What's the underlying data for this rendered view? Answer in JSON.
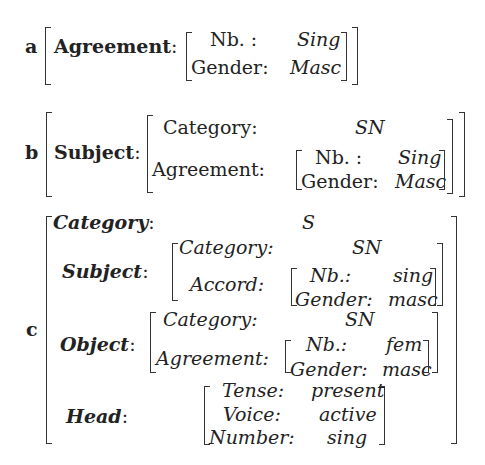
{
  "a": {
    "label": "a",
    "feature": "Agreement",
    "colon": ":",
    "inner": [
      {
        "attr": "Nb. :",
        "value": "Sing"
      },
      {
        "attr": "Gender:",
        "value": "Masc"
      }
    ]
  },
  "b": {
    "label": "b",
    "feature": "Subject",
    "colon": ":",
    "rows": [
      {
        "attr": "Category:",
        "value": "SN"
      },
      {
        "attr": "Agreement:",
        "inner": [
          {
            "attr": "Nb. :",
            "value": "Sing"
          },
          {
            "attr": "Gender:",
            "value": "Masc"
          }
        ]
      }
    ]
  },
  "c": {
    "label": "c",
    "category": {
      "attr": "Category",
      "colon": ":",
      "value": "S"
    },
    "subject": {
      "attr": "Subject",
      "colon": ":",
      "rows": [
        {
          "attr": "Category:",
          "value": "SN"
        },
        {
          "attr": "Accord:",
          "inner": [
            {
              "attr": "Nb.:",
              "value": "sing"
            },
            {
              "attr": "Gender:",
              "value": "masc"
            }
          ]
        }
      ]
    },
    "object": {
      "attr": "Object",
      "colon": ":",
      "rows": [
        {
          "attr": "Category:",
          "value": "SN"
        },
        {
          "attr": "Agreement:",
          "inner": [
            {
              "attr": "Nb.:",
              "value": "fem"
            },
            {
              "attr": "Gender:",
              "value": "masc"
            }
          ]
        }
      ]
    },
    "head": {
      "attr": "Head",
      "colon": ":",
      "rows": [
        {
          "attr": "Tense:",
          "value": "present"
        },
        {
          "attr": "Voice:",
          "value": "active"
        },
        {
          "attr": "Number:",
          "value": "sing"
        }
      ]
    }
  }
}
